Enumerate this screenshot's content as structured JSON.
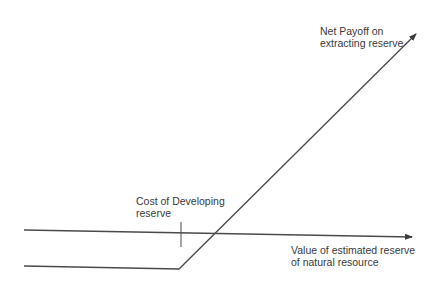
{
  "diagram": {
    "labels": {
      "payoff_line_1": "Net Payoff on",
      "payoff_line_2": "extracting reserve",
      "cost_line_1": "Cost of Developing",
      "cost_line_2": "reserve",
      "axis_line_1": "Value of estimated reserve",
      "axis_line_2": "of natural resource"
    },
    "colors": {
      "line": "#4a4a4a",
      "text": "#3a3a3a",
      "background": "#ffffff"
    }
  }
}
